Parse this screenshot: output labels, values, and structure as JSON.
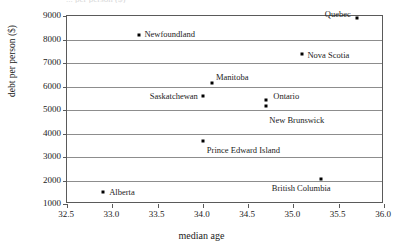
{
  "figure": {
    "top_clipped_text": "... per person ($)"
  },
  "chart_data": {
    "type": "scatter",
    "title": "",
    "xlabel": "median age",
    "ylabel": "debt per person ($)",
    "xlim": [
      32.5,
      36.0
    ],
    "ylim": [
      1000,
      9000
    ],
    "xticks": [
      "32.5",
      "33.0",
      "33.5",
      "34.0",
      "34.5",
      "35.0",
      "35.5",
      "36.0"
    ],
    "xtick_values": [
      32.5,
      33.0,
      33.5,
      34.0,
      34.5,
      35.0,
      35.5,
      36.0
    ],
    "yticks": [
      "1000",
      "2000",
      "3000",
      "4000",
      "5000",
      "6000",
      "7000",
      "8000",
      "9000"
    ],
    "ytick_values": [
      1000,
      2000,
      3000,
      4000,
      5000,
      6000,
      7000,
      8000,
      9000
    ],
    "grid": "horizontal",
    "legend": "none",
    "marker_color": "#000000",
    "points": [
      {
        "label": "Quebec",
        "x": 35.7,
        "y": 8900,
        "label_pos": "left",
        "dx": -6,
        "dy": -4
      },
      {
        "label": "Newfoundland",
        "x": 33.3,
        "y": 8200,
        "label_pos": "right",
        "dx": 5,
        "dy": -1
      },
      {
        "label": "Nova Scotia",
        "x": 35.1,
        "y": 7400,
        "label_pos": "right",
        "dx": 5,
        "dy": 1
      },
      {
        "label": "Manitoba",
        "x": 34.1,
        "y": 6150,
        "label_pos": "right",
        "dx": 4,
        "dy": -6
      },
      {
        "label": "Saskatchewan",
        "x": 34.0,
        "y": 5600,
        "label_pos": "left",
        "dx": -5,
        "dy": 0
      },
      {
        "label": "Ontario",
        "x": 34.7,
        "y": 5430,
        "label_pos": "right",
        "dx": 7,
        "dy": -4
      },
      {
        "label": "New Brunswick",
        "x": 34.7,
        "y": 5180,
        "label_pos": "right",
        "dx": 3,
        "dy": 14
      },
      {
        "label": "Prince Edward Island",
        "x": 34.0,
        "y": 3700,
        "label_pos": "right",
        "dx": 4,
        "dy": 9
      },
      {
        "label": "British Columbia",
        "x": 35.3,
        "y": 2050,
        "label_pos": "below-left",
        "dx": 10,
        "dy": 5
      },
      {
        "label": "Alberta",
        "x": 32.9,
        "y": 1500,
        "label_pos": "right",
        "dx": 6,
        "dy": 0
      }
    ]
  }
}
